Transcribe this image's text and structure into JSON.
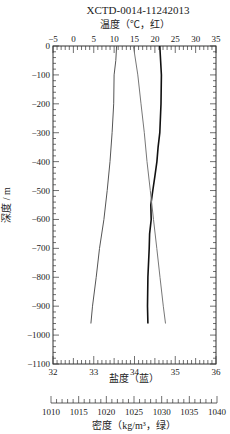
{
  "chart_data": {
    "type": "line",
    "title": "XCTD-0014-11242013",
    "ylabel": "深度 / m",
    "ylim": [
      -1100,
      0
    ],
    "y_ticks": [
      0,
      -100,
      -200,
      -300,
      -400,
      -500,
      -600,
      -700,
      -800,
      -900,
      -1000,
      -1100
    ],
    "axes": {
      "temperature": {
        "label": "温度（℃，红）",
        "position": "top",
        "range": [
          -5,
          35
        ],
        "ticks": [
          -5,
          0,
          5,
          10,
          15,
          20,
          25,
          30,
          35
        ]
      },
      "salinity": {
        "label": "盐度（蓝）",
        "position": "bottom",
        "range": [
          32,
          36
        ],
        "ticks": [
          32,
          33,
          34,
          35,
          36
        ]
      },
      "density": {
        "label": "密度（kg/m³，绿）",
        "position": "bottom-separate",
        "range": [
          1010,
          1040
        ],
        "ticks": [
          1010,
          1015,
          1020,
          1025,
          1030,
          1035,
          1040
        ]
      }
    },
    "series": [
      {
        "name": "温度",
        "axis": "temperature",
        "color": "#555555",
        "depth": [
          0,
          -50,
          -100,
          -200,
          -300,
          -400,
          -500,
          -600,
          -700,
          -800,
          -900,
          -960
        ],
        "values": [
          10.6,
          10.4,
          10.0,
          9.9,
          9.5,
          9.0,
          8.3,
          7.5,
          6.4,
          5.6,
          4.7,
          4.3
        ]
      },
      {
        "name": "盐度",
        "axis": "salinity",
        "color": "#111111",
        "depth": [
          0,
          -100,
          -200,
          -300,
          -350,
          -400,
          -450,
          -500,
          -550,
          -600,
          -650,
          -700,
          -800,
          -900,
          -960
        ],
        "values": [
          34.62,
          34.66,
          34.65,
          34.62,
          34.58,
          34.55,
          34.5,
          34.45,
          34.4,
          34.41,
          34.37,
          34.36,
          34.33,
          34.32,
          34.33
        ]
      },
      {
        "name": "密度",
        "axis": "density",
        "color": "#777777",
        "depth": [
          0,
          -100,
          -200,
          -300,
          -400,
          -500,
          -600,
          -700,
          -800,
          -900,
          -960
        ],
        "values": [
          1024.8,
          1025.6,
          1026.2,
          1026.8,
          1027.3,
          1027.9,
          1028.5,
          1029.1,
          1029.7,
          1030.3,
          1030.7
        ]
      }
    ]
  }
}
